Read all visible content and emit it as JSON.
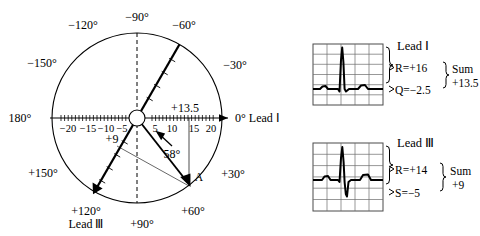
{
  "axis_diagram": {
    "name": "hexaxial-reference-circle",
    "degree_labels": [
      {
        "id": "deg-minus-90",
        "text": "−90°"
      },
      {
        "id": "deg-minus-120",
        "text": "−120°"
      },
      {
        "id": "deg-minus-150",
        "text": "−150°"
      },
      {
        "id": "deg-180",
        "text": "180°"
      },
      {
        "id": "deg-plus-150",
        "text": "+150°"
      },
      {
        "id": "deg-plus-120",
        "text": "+120°"
      },
      {
        "id": "deg-plus-90",
        "text": "+90°"
      },
      {
        "id": "deg-plus-60",
        "text": "+60°"
      },
      {
        "id": "deg-plus-30",
        "text": "+30°"
      },
      {
        "id": "deg-0",
        "text": "0° Lead Ⅰ"
      },
      {
        "id": "deg-minus-30",
        "text": "−30°"
      },
      {
        "id": "deg-minus-60",
        "text": "−60°"
      }
    ],
    "lead_i_axis": {
      "label": "0° Lead Ⅰ",
      "scale_negative": [
        "−20",
        "−15",
        "−10",
        "−5"
      ],
      "scale_positive": [
        "5",
        "10",
        "15",
        "20"
      ],
      "projection_value": "+13.5"
    },
    "lead_iii_axis": {
      "label": "Lead Ⅲ",
      "angle_label": "+120°",
      "projection_value": "+9"
    },
    "resultant_vector": {
      "point_label": "A",
      "angle_label": "58°"
    }
  },
  "ecg_strips": [
    {
      "id": "strip-lead-i",
      "lead_label": "Lead Ⅰ",
      "measurements": [
        {
          "id": "r-wave",
          "text": "R=+16"
        },
        {
          "id": "q-wave",
          "text": "Q=−2.5"
        }
      ],
      "sum_label": "Sum",
      "sum_value": "+13.5",
      "grid": {
        "cols": 5,
        "rows": 6
      }
    },
    {
      "id": "strip-lead-iii",
      "lead_label": "Lead Ⅲ",
      "measurements": [
        {
          "id": "r-wave",
          "text": "R=+14"
        },
        {
          "id": "s-wave",
          "text": "S=−5"
        }
      ],
      "sum_label": "Sum",
      "sum_value": "+9",
      "grid": {
        "cols": 5,
        "rows": 6
      }
    }
  ],
  "colors": {
    "ink": "#000000",
    "grid": "#555555",
    "thin": "#333333",
    "background": "#ffffff"
  }
}
